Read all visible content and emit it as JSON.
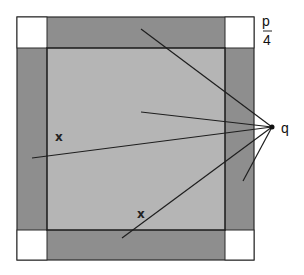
{
  "diagram": {
    "type": "geometry-square-with-border",
    "colors": {
      "background": "#ffffff",
      "inner_square": "#b5b5b5",
      "border_strips": "#8e8e8e",
      "corner_squares": "#ffffff",
      "outline": "#2a2a2a",
      "lines": "#1e1e1e"
    },
    "outer_square": {
      "x": 17,
      "y": 17,
      "w": 237,
      "h": 243
    },
    "inner_square": {
      "x": 47,
      "y": 48,
      "w": 178,
      "h": 182
    },
    "point_q": {
      "x": 272,
      "y": 127
    },
    "rays_from_q": [
      {
        "to": [
          141,
          29
        ]
      },
      {
        "to": [
          141,
          112
        ]
      },
      {
        "to": [
          32,
          158
        ]
      },
      {
        "to": [
          122,
          238
        ]
      },
      {
        "to": [
          243,
          181
        ]
      }
    ],
    "labels": {
      "fraction_numerator": "p",
      "fraction_denominator": "4",
      "point_label": "q",
      "side_label_left": "x",
      "side_label_bottom": "x"
    }
  }
}
